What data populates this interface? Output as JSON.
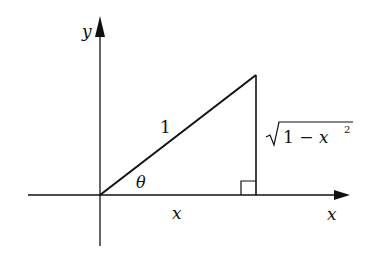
{
  "diagram": {
    "type": "right-triangle-unit-circle",
    "axes": {
      "x_label": "x",
      "y_label": "y"
    },
    "triangle": {
      "hypotenuse_label": "1",
      "angle_label": "θ",
      "base_label": "x",
      "height_label_radicand": "1 − x",
      "height_label_exponent": "2",
      "right_angle_marker": true
    },
    "colors": {
      "ink": "#111111",
      "background": "#ffffff"
    }
  }
}
